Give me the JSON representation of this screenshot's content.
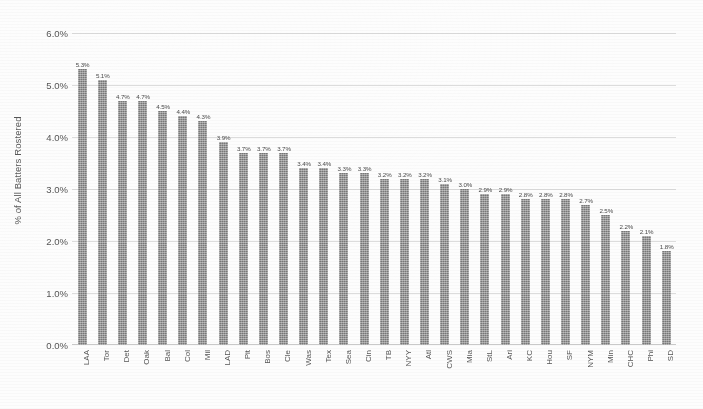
{
  "chart_data": {
    "type": "bar",
    "title": "",
    "subtitle": "",
    "xlabel": "",
    "ylabel": "% of All Batters Rostered",
    "ylim": [
      0,
      6
    ],
    "ytick_labels": [
      "6.0%",
      "5.0%",
      "4.0%",
      "3.0%",
      "2.0%",
      "1.0%",
      "0.0%"
    ],
    "ytick_values": [
      6,
      5,
      4,
      3,
      2,
      1,
      0
    ],
    "ytick_format": "percent_one_decimal",
    "grid": true,
    "grid_axis": "y",
    "legend": false,
    "legend_position": "none",
    "bar_color": "#868686",
    "data_labels": true,
    "categories": [
      "LAA",
      "Tor",
      "Det",
      "Oak",
      "Bal",
      "Col",
      "Mil",
      "LAD",
      "Pit",
      "Bos",
      "Cle",
      "Was",
      "Tex",
      "Sea",
      "Cin",
      "TB",
      "NYY",
      "Atl",
      "CWS",
      "Mia",
      "StL",
      "Ari",
      "KC",
      "Hou",
      "SF",
      "NYM",
      "Min",
      "CHC",
      "Phi",
      "SD"
    ],
    "values": [
      5.3,
      5.1,
      4.7,
      4.7,
      4.5,
      4.4,
      4.3,
      3.9,
      3.7,
      3.7,
      3.7,
      3.4,
      3.4,
      3.3,
      3.3,
      3.2,
      3.2,
      3.2,
      3.1,
      3.0,
      2.9,
      2.9,
      2.8,
      2.8,
      2.8,
      2.7,
      2.5,
      2.2,
      2.1,
      1.8
    ],
    "value_labels": [
      "5.3%",
      "5.1%",
      "4.7%",
      "4.7%",
      "4.5%",
      "4.4%",
      "4.3%",
      "3.9%",
      "3.7%",
      "3.7%",
      "3.7%",
      "3.4%",
      "3.4%",
      "3.3%",
      "3.3%",
      "3.2%",
      "3.2%",
      "3.2%",
      "3.1%",
      "3.0%",
      "2.9%",
      "2.9%",
      "2.8%",
      "2.8%",
      "2.8%",
      "2.7%",
      "2.5%",
      "2.2%",
      "2.1%",
      "1.8%"
    ],
    "points": [
      {
        "category": "LAA",
        "value": 5.3,
        "label": "5.3%"
      },
      {
        "category": "Tor",
        "value": 5.1,
        "label": "5.1%"
      },
      {
        "category": "Det",
        "value": 4.7,
        "label": "4.7%"
      },
      {
        "category": "Oak",
        "value": 4.7,
        "label": "4.7%"
      },
      {
        "category": "Bal",
        "value": 4.5,
        "label": "4.5%"
      },
      {
        "category": "Col",
        "value": 4.4,
        "label": "4.4%"
      },
      {
        "category": "Mil",
        "value": 4.3,
        "label": "4.3%"
      },
      {
        "category": "LAD",
        "value": 3.9,
        "label": "3.9%"
      },
      {
        "category": "Pit",
        "value": 3.7,
        "label": "3.7%"
      },
      {
        "category": "Bos",
        "value": 3.7,
        "label": "3.7%"
      },
      {
        "category": "Cle",
        "value": 3.7,
        "label": "3.7%"
      },
      {
        "category": "Was",
        "value": 3.4,
        "label": "3.4%"
      },
      {
        "category": "Tex",
        "value": 3.4,
        "label": "3.4%"
      },
      {
        "category": "Sea",
        "value": 3.3,
        "label": "3.3%"
      },
      {
        "category": "Cin",
        "value": 3.3,
        "label": "3.3%"
      },
      {
        "category": "TB",
        "value": 3.2,
        "label": "3.2%"
      },
      {
        "category": "NYY",
        "value": 3.2,
        "label": "3.2%"
      },
      {
        "category": "Atl",
        "value": 3.2,
        "label": "3.2%"
      },
      {
        "category": "CWS",
        "value": 3.1,
        "label": "3.1%"
      },
      {
        "category": "Mia",
        "value": 3.0,
        "label": "3.0%"
      },
      {
        "category": "StL",
        "value": 2.9,
        "label": "2.9%"
      },
      {
        "category": "Ari",
        "value": 2.9,
        "label": "2.9%"
      },
      {
        "category": "KC",
        "value": 2.8,
        "label": "2.8%"
      },
      {
        "category": "Hou",
        "value": 2.8,
        "label": "2.8%"
      },
      {
        "category": "SF",
        "value": 2.8,
        "label": "2.8%"
      },
      {
        "category": "NYM",
        "value": 2.7,
        "label": "2.7%"
      },
      {
        "category": "Min",
        "value": 2.5,
        "label": "2.5%"
      },
      {
        "category": "CHC",
        "value": 2.2,
        "label": "2.2%"
      },
      {
        "category": "Phi",
        "value": 2.1,
        "label": "2.1%"
      },
      {
        "category": "SD",
        "value": 1.8,
        "label": "1.8%"
      }
    ]
  }
}
